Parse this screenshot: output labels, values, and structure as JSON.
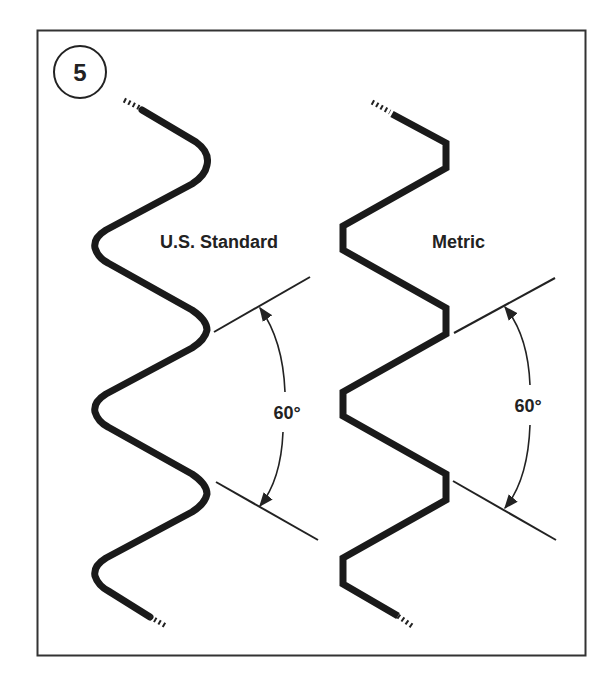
{
  "figure": {
    "step_number": "5",
    "profiles": [
      {
        "id": "us-standard",
        "label": "U.S. Standard",
        "angle_label": "60°",
        "crest_style": "rounded"
      },
      {
        "id": "metric",
        "label": "Metric",
        "angle_label": "60°",
        "crest_style": "flat"
      }
    ]
  },
  "colors": {
    "ink": "#222222",
    "background": "#ffffff"
  }
}
